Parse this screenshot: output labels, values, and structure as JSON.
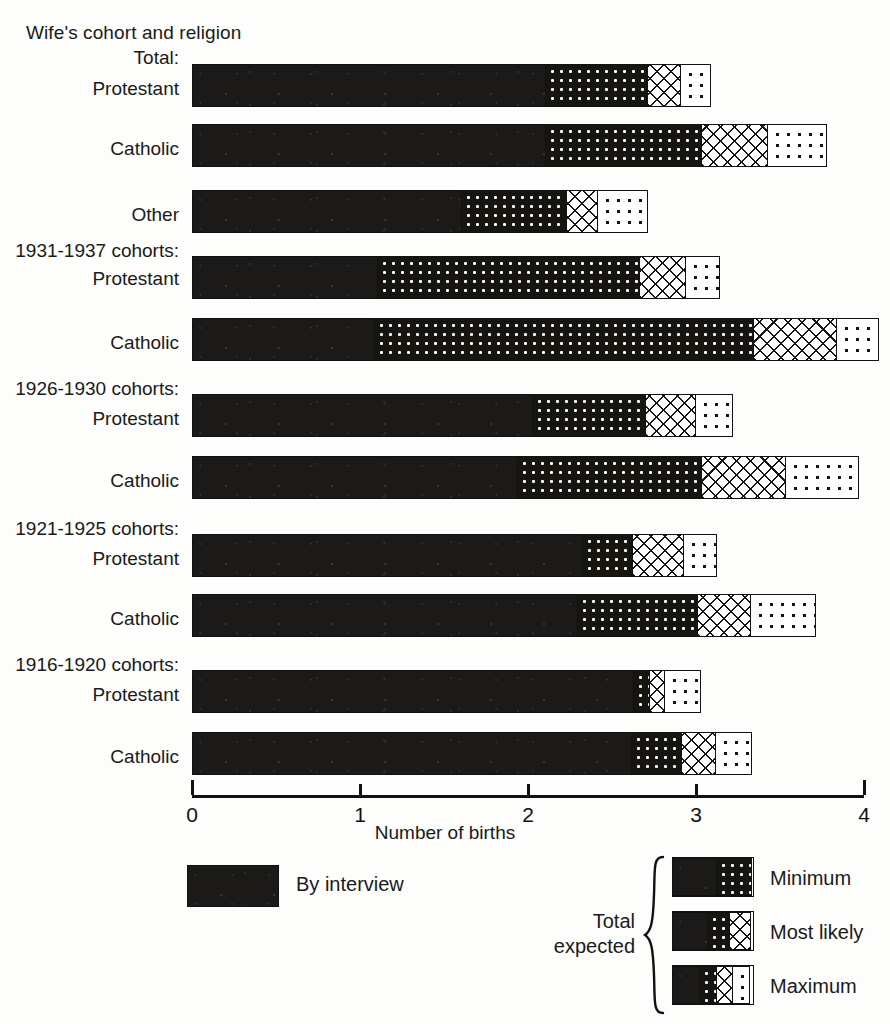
{
  "header": {
    "title": "Wife's cohort and religion",
    "total_label": "Total:"
  },
  "axis": {
    "xlabel": "Number of births",
    "ticks": [
      "0",
      "1",
      "2",
      "3",
      "4"
    ]
  },
  "groups": [
    {
      "caption": "Total:",
      "rows": [
        "Protestant",
        "Catholic",
        "Other"
      ]
    },
    {
      "caption": "1931-1937 cohorts:",
      "rows": [
        "Protestant",
        "Catholic"
      ]
    },
    {
      "caption": "1926-1930 cohorts:",
      "rows": [
        "Protestant",
        "Catholic"
      ]
    },
    {
      "caption": "1921-1925 cohorts:",
      "rows": [
        "Protestant",
        "Catholic"
      ]
    },
    {
      "caption": "1916-1920 cohorts:",
      "rows": [
        "Protestant",
        "Catholic"
      ]
    }
  ],
  "legend": {
    "by_interview": "By interview",
    "total_expected": "Total\nexpected",
    "total_expected_line1": "Total",
    "total_expected_line2": "expected",
    "minimum": "Minimum",
    "most_likely": "Most likely",
    "maximum": "Maximum"
  },
  "chart_data": {
    "type": "bar",
    "orientation": "horizontal",
    "stacked": true,
    "title": "Wife's cohort and religion",
    "xlabel": "Number of births",
    "ylabel": "",
    "xlim": [
      0,
      4
    ],
    "xticks": [
      0,
      1,
      2,
      3,
      4
    ],
    "grid": false,
    "legend_position": "bottom",
    "series": [
      {
        "name": "By interview",
        "pattern": "solid-black"
      },
      {
        "name": "Minimum",
        "pattern": "dots-on-black"
      },
      {
        "name": "Most likely",
        "pattern": "crosshatch"
      },
      {
        "name": "Maximum",
        "pattern": "dots-on-white"
      }
    ],
    "categories": [
      "Total: Protestant",
      "Total: Catholic",
      "Total: Other",
      "1931-1937 cohorts: Protestant",
      "1931-1937 cohorts: Catholic",
      "1926-1930 cohorts: Protestant",
      "1926-1930 cohorts: Catholic",
      "1921-1925 cohorts: Protestant",
      "1921-1925 cohorts: Catholic",
      "1916-1920 cohorts: Protestant",
      "1916-1920 cohorts: Catholic"
    ],
    "cumulative_values": [
      {
        "category": "Total: Protestant",
        "by_interview": 2.11,
        "minimum": 2.72,
        "most_likely": 2.92,
        "maximum": 3.11
      },
      {
        "category": "Total: Catholic",
        "by_interview": 2.11,
        "minimum": 3.04,
        "most_likely": 3.44,
        "maximum": 3.8
      },
      {
        "category": "Total: Other",
        "by_interview": 1.61,
        "minimum": 2.24,
        "most_likely": 2.43,
        "maximum": 2.73
      },
      {
        "category": "1931-1937 cohorts: Protestant",
        "by_interview": 1.11,
        "minimum": 2.67,
        "most_likely": 2.95,
        "maximum": 3.16
      },
      {
        "category": "1931-1937 cohorts: Catholic",
        "by_interview": 1.09,
        "minimum": 3.35,
        "most_likely": 3.85,
        "maximum": 4.11
      },
      {
        "category": "1926-1930 cohorts: Protestant",
        "by_interview": 2.03,
        "minimum": 2.71,
        "most_likely": 3.01,
        "maximum": 3.24
      },
      {
        "category": "1926-1930 cohorts: Catholic",
        "by_interview": 1.94,
        "minimum": 3.04,
        "most_likely": 3.55,
        "maximum": 3.99
      },
      {
        "category": "1921-1925 cohorts: Protestant",
        "by_interview": 2.33,
        "minimum": 2.63,
        "most_likely": 2.94,
        "maximum": 3.14
      },
      {
        "category": "1921-1925 cohorts: Catholic",
        "by_interview": 2.3,
        "minimum": 3.02,
        "most_likely": 3.34,
        "maximum": 3.73
      },
      {
        "category": "1916-1920 cohorts: Protestant",
        "by_interview": 2.63,
        "minimum": 2.73,
        "most_likely": 2.83,
        "maximum": 3.05
      },
      {
        "category": "1916-1920 cohorts: Catholic",
        "by_interview": 2.62,
        "minimum": 2.92,
        "most_likely": 3.13,
        "maximum": 3.35
      }
    ]
  },
  "layout": {
    "bar_top_px": [
      64,
      124,
      190,
      256,
      318,
      394,
      456,
      534,
      594,
      670,
      732
    ],
    "caption_top_px": [
      47,
      240,
      378,
      518,
      654
    ],
    "rowlabel_top_px": [
      78,
      138,
      204,
      268,
      332,
      408,
      470,
      548,
      608,
      684,
      746
    ]
  }
}
